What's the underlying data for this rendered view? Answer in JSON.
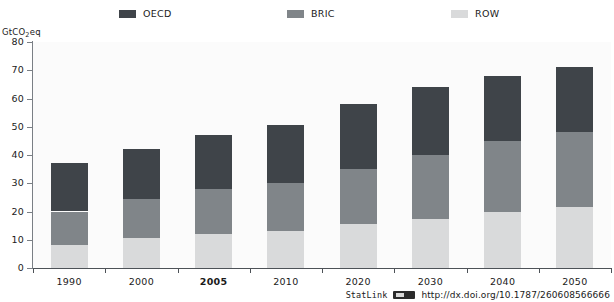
{
  "figure": {
    "title_fragment": "",
    "unit_label": "GtCO",
    "unit_sub": "2",
    "unit_suffix": "eq"
  },
  "legend": {
    "position": "top",
    "items": [
      {
        "label": "OECD",
        "color": "#3f4449"
      },
      {
        "label": "BRIC",
        "color": "#808589"
      },
      {
        "label": "ROW",
        "color": "#d9dadb"
      }
    ]
  },
  "footer": {
    "statlink_word": "StatLink",
    "statlink_icon": "statlink-badge-icon",
    "url": "http://dx.doi.org/10.1787/260608566666"
  },
  "chart_data": {
    "type": "bar",
    "stacked": true,
    "title": "",
    "xlabel": "",
    "ylabel": "GtCO2eq",
    "ylim": [
      0,
      80
    ],
    "ytick_values": [
      0,
      10,
      20,
      30,
      40,
      50,
      60,
      70,
      80
    ],
    "ytick_labels": [
      "0",
      "10",
      "20",
      "30",
      "40",
      "50",
      "60",
      "70",
      "80"
    ],
    "grid": false,
    "categories": [
      "1990",
      "2000",
      "2005",
      "2010",
      "2020",
      "2030",
      "2040",
      "2050"
    ],
    "highlighted_category": "2005",
    "series": [
      {
        "name": "ROW",
        "color": "#d9dadb",
        "values": [
          8.0,
          10.5,
          12.0,
          13.0,
          15.5,
          17.5,
          20.0,
          21.5
        ]
      },
      {
        "name": "BRIC",
        "color": "#808589",
        "values": [
          12.0,
          14.0,
          16.0,
          17.0,
          19.5,
          22.5,
          25.0,
          26.5
        ]
      },
      {
        "name": "OECD",
        "color": "#3f4449",
        "values": [
          17.0,
          17.5,
          19.0,
          20.5,
          23.0,
          24.0,
          23.0,
          23.0
        ]
      }
    ],
    "totals": [
      37.0,
      42.0,
      47.0,
      50.5,
      58.0,
      64.0,
      68.0,
      71.0
    ]
  }
}
